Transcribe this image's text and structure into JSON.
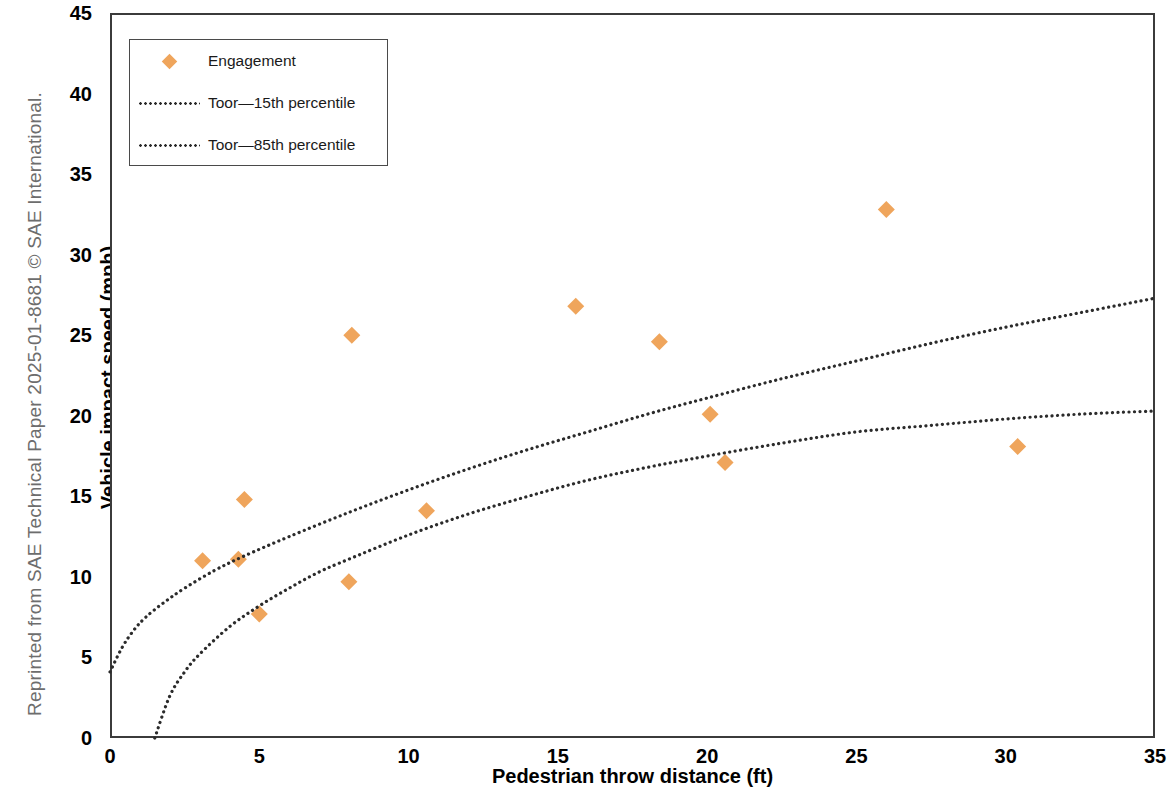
{
  "credit": "Reprinted from SAE Technical Paper 2025-01-8681 © SAE International.",
  "legend": {
    "items": [
      {
        "label": "Engagement",
        "key": "diamond-marker",
        "color": "#efa55c"
      },
      {
        "label": "Toor—15th percentile",
        "key": "dotted-line",
        "color": "#2b2b2b"
      },
      {
        "label": "Toor—85th percentile",
        "key": "dotted-line",
        "color": "#2b2b2b"
      }
    ]
  },
  "chart_data": {
    "type": "scatter",
    "title": "",
    "xlabel": "Pedestrian throw distance (ft)",
    "ylabel": "Vehicle impact speed (mph)",
    "xlim": [
      0,
      35
    ],
    "ylim": [
      0,
      45
    ],
    "xticks": [
      0,
      5,
      10,
      15,
      20,
      25,
      30,
      35
    ],
    "yticks": [
      0,
      5,
      10,
      15,
      20,
      25,
      30,
      35,
      40,
      45
    ],
    "grid": false,
    "legend_position": "top-left",
    "series": [
      {
        "name": "Engagement",
        "type": "scatter",
        "marker": "diamond",
        "color": "#efa55c",
        "points": [
          {
            "x": 3.1,
            "y": 11.0
          },
          {
            "x": 4.3,
            "y": 11.1
          },
          {
            "x": 4.5,
            "y": 14.8
          },
          {
            "x": 5.0,
            "y": 7.7
          },
          {
            "x": 8.0,
            "y": 9.7
          },
          {
            "x": 8.1,
            "y": 25.0
          },
          {
            "x": 10.6,
            "y": 14.1
          },
          {
            "x": 15.6,
            "y": 26.8
          },
          {
            "x": 18.4,
            "y": 24.6
          },
          {
            "x": 20.1,
            "y": 20.1
          },
          {
            "x": 20.6,
            "y": 17.1
          },
          {
            "x": 26.0,
            "y": 32.8
          },
          {
            "x": 30.4,
            "y": 18.1
          }
        ]
      },
      {
        "name": "Toor—15th percentile",
        "type": "line",
        "style": "dotted",
        "color": "#2b2b2b",
        "points": [
          {
            "x": 1.5,
            "y": 0.0
          },
          {
            "x": 2.0,
            "y": 2.6
          },
          {
            "x": 2.5,
            "y": 4.1
          },
          {
            "x": 3.0,
            "y": 5.2
          },
          {
            "x": 4.0,
            "y": 6.9
          },
          {
            "x": 5.0,
            "y": 8.2
          },
          {
            "x": 6.0,
            "y": 9.3
          },
          {
            "x": 7.0,
            "y": 10.3
          },
          {
            "x": 8.0,
            "y": 11.1
          },
          {
            "x": 10.0,
            "y": 12.6
          },
          {
            "x": 12.0,
            "y": 13.9
          },
          {
            "x": 14.0,
            "y": 15.0
          },
          {
            "x": 16.0,
            "y": 16.0
          },
          {
            "x": 18.0,
            "y": 16.8
          },
          {
            "x": 20.0,
            "y": 17.5
          },
          {
            "x": 22.5,
            "y": 18.3
          },
          {
            "x": 25.0,
            "y": 19.0
          },
          {
            "x": 27.5,
            "y": 19.4
          },
          {
            "x": 30.0,
            "y": 19.8
          },
          {
            "x": 32.5,
            "y": 20.1
          },
          {
            "x": 35.0,
            "y": 20.3
          }
        ]
      },
      {
        "name": "Toor—85th percentile",
        "type": "line",
        "style": "dotted",
        "color": "#2b2b2b",
        "points": [
          {
            "x": 0.0,
            "y": 4.1
          },
          {
            "x": 0.4,
            "y": 5.6
          },
          {
            "x": 0.8,
            "y": 6.7
          },
          {
            "x": 1.2,
            "y": 7.5
          },
          {
            "x": 1.8,
            "y": 8.4
          },
          {
            "x": 2.5,
            "y": 9.3
          },
          {
            "x": 3.5,
            "y": 10.4
          },
          {
            "x": 4.5,
            "y": 11.3
          },
          {
            "x": 6.0,
            "y": 12.5
          },
          {
            "x": 8.0,
            "y": 14.0
          },
          {
            "x": 10.0,
            "y": 15.4
          },
          {
            "x": 12.0,
            "y": 16.7
          },
          {
            "x": 14.0,
            "y": 17.9
          },
          {
            "x": 16.0,
            "y": 19.0
          },
          {
            "x": 18.0,
            "y": 20.1
          },
          {
            "x": 20.0,
            "y": 21.1
          },
          {
            "x": 22.5,
            "y": 22.3
          },
          {
            "x": 25.0,
            "y": 23.4
          },
          {
            "x": 27.5,
            "y": 24.5
          },
          {
            "x": 30.0,
            "y": 25.5
          },
          {
            "x": 32.5,
            "y": 26.4
          },
          {
            "x": 35.0,
            "y": 27.3
          }
        ]
      }
    ]
  }
}
